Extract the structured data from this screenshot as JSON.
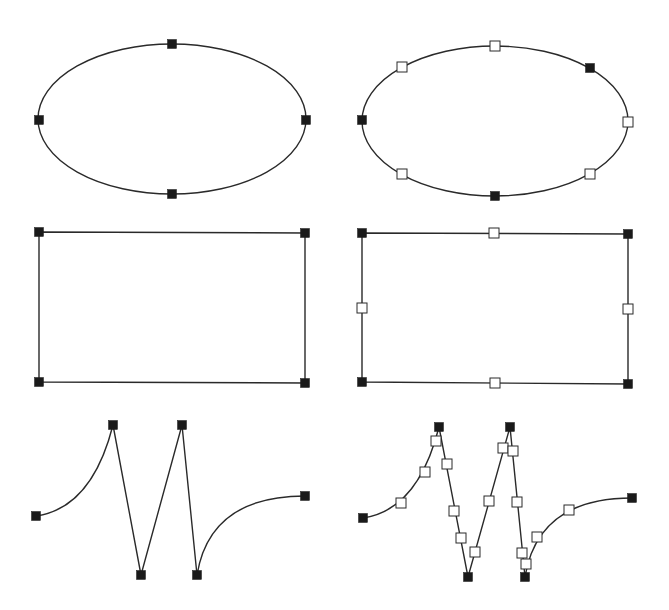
{
  "colors": {
    "background": "#ffffff",
    "stroke": "#2a2a2a",
    "filled_handle": "#1a1a1a",
    "hollow_handle_fill": "#ffffff",
    "hollow_handle_border": "#2a2a2a"
  },
  "handle_size": {
    "filled": 9,
    "hollow": 10
  },
  "panels": [
    {
      "id": "ellipse-original",
      "shape": "ellipse",
      "cx": 172,
      "cy": 119,
      "rx": 134,
      "ry": 75,
      "handles": [
        {
          "x": 172,
          "y": 44,
          "type": "filled"
        },
        {
          "x": 39,
          "y": 120,
          "type": "filled"
        },
        {
          "x": 306,
          "y": 120,
          "type": "filled"
        },
        {
          "x": 172,
          "y": 194,
          "type": "filled"
        }
      ]
    },
    {
      "id": "ellipse-subdivided",
      "shape": "ellipse",
      "cx": 495,
      "cy": 121,
      "rx": 133,
      "ry": 75,
      "handles": [
        {
          "x": 495,
          "y": 46,
          "type": "hollow"
        },
        {
          "x": 402,
          "y": 67,
          "type": "hollow"
        },
        {
          "x": 590,
          "y": 68,
          "type": "filled"
        },
        {
          "x": 362,
          "y": 120,
          "type": "filled"
        },
        {
          "x": 628,
          "y": 122,
          "type": "hollow"
        },
        {
          "x": 402,
          "y": 174,
          "type": "hollow"
        },
        {
          "x": 590,
          "y": 174,
          "type": "hollow"
        },
        {
          "x": 495,
          "y": 196,
          "type": "filled"
        }
      ]
    },
    {
      "id": "rectangle-original",
      "shape": "polygon",
      "points": [
        [
          39,
          232
        ],
        [
          305,
          233
        ],
        [
          305,
          383
        ],
        [
          39,
          382
        ]
      ],
      "handles": [
        {
          "x": 39,
          "y": 232,
          "type": "filled"
        },
        {
          "x": 305,
          "y": 233,
          "type": "filled"
        },
        {
          "x": 39,
          "y": 382,
          "type": "filled"
        },
        {
          "x": 305,
          "y": 383,
          "type": "filled"
        }
      ]
    },
    {
      "id": "rectangle-subdivided",
      "shape": "polygon",
      "points": [
        [
          362,
          233
        ],
        [
          628,
          234
        ],
        [
          628,
          384
        ],
        [
          362,
          382
        ]
      ],
      "handles": [
        {
          "x": 362,
          "y": 233,
          "type": "filled"
        },
        {
          "x": 628,
          "y": 234,
          "type": "filled"
        },
        {
          "x": 362,
          "y": 382,
          "type": "filled"
        },
        {
          "x": 628,
          "y": 384,
          "type": "filled"
        },
        {
          "x": 494,
          "y": 233,
          "type": "hollow"
        },
        {
          "x": 362,
          "y": 308,
          "type": "hollow"
        },
        {
          "x": 628,
          "y": 309,
          "type": "hollow"
        },
        {
          "x": 495,
          "y": 383,
          "type": "hollow"
        }
      ]
    },
    {
      "id": "path-original",
      "shape": "path",
      "d": "M36,516 Q92,508 113,425 L141,575 L182,425 L197,575 Q210,496 305,496",
      "handles": [
        {
          "x": 36,
          "y": 516,
          "type": "filled"
        },
        {
          "x": 113,
          "y": 425,
          "type": "filled"
        },
        {
          "x": 141,
          "y": 575,
          "type": "filled"
        },
        {
          "x": 182,
          "y": 425,
          "type": "filled"
        },
        {
          "x": 197,
          "y": 575,
          "type": "filled"
        },
        {
          "x": 305,
          "y": 496,
          "type": "filled"
        }
      ]
    },
    {
      "id": "path-subdivided",
      "shape": "path",
      "d": "M363,518 Q418,510 439,427 L468,577 L510,427 L525,577 Q538,498 632,498",
      "handles": [
        {
          "x": 363,
          "y": 518,
          "type": "filled"
        },
        {
          "x": 401,
          "y": 503,
          "type": "hollow"
        },
        {
          "x": 425,
          "y": 472,
          "type": "hollow"
        },
        {
          "x": 436,
          "y": 441,
          "type": "hollow"
        },
        {
          "x": 439,
          "y": 427,
          "type": "filled"
        },
        {
          "x": 447,
          "y": 464,
          "type": "hollow"
        },
        {
          "x": 454,
          "y": 511,
          "type": "hollow"
        },
        {
          "x": 461,
          "y": 538,
          "type": "hollow"
        },
        {
          "x": 468,
          "y": 577,
          "type": "filled"
        },
        {
          "x": 475,
          "y": 552,
          "type": "hollow"
        },
        {
          "x": 489,
          "y": 501,
          "type": "hollow"
        },
        {
          "x": 503,
          "y": 448,
          "type": "hollow"
        },
        {
          "x": 510,
          "y": 427,
          "type": "filled"
        },
        {
          "x": 513,
          "y": 451,
          "type": "hollow"
        },
        {
          "x": 517,
          "y": 502,
          "type": "hollow"
        },
        {
          "x": 522,
          "y": 553,
          "type": "hollow"
        },
        {
          "x": 526,
          "y": 564,
          "type": "hollow"
        },
        {
          "x": 525,
          "y": 577,
          "type": "filled"
        },
        {
          "x": 537,
          "y": 537,
          "type": "hollow"
        },
        {
          "x": 569,
          "y": 510,
          "type": "hollow"
        },
        {
          "x": 632,
          "y": 498,
          "type": "filled"
        }
      ]
    }
  ]
}
